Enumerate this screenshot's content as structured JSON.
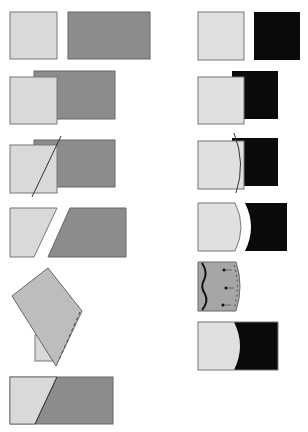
{
  "diagram": {
    "type": "seam-construction-steps",
    "colors": {
      "light_fabric": "#d9d9d9",
      "medium_fabric": "#8c8c8c",
      "dark_fabric": "#0a0a0a",
      "outline": "#6e6e6e",
      "cut_line": "#333333",
      "background": "#ffffff"
    },
    "columns": [
      {
        "name": "straight-seam",
        "steps": [
          {
            "id": "L1",
            "description": "Two separate pieces: light square and medium rectangle"
          },
          {
            "id": "L2",
            "description": "Light square overlapped on medium rectangle"
          },
          {
            "id": "L3",
            "description": "Diagonal cut line through overlap"
          },
          {
            "id": "L4",
            "description": "Pieces cut apart along diagonal"
          },
          {
            "id": "L5",
            "description": "Light piece flipped over and stitched along seam"
          },
          {
            "id": "L6",
            "description": "Finished joined rectangle with diagonal seam"
          }
        ]
      },
      {
        "name": "curved-seam",
        "steps": [
          {
            "id": "R1",
            "description": "Two separate pieces: light square and black square"
          },
          {
            "id": "R2",
            "description": "Light square overlapped on black square"
          },
          {
            "id": "R3",
            "description": "Curved cut line through overlap"
          },
          {
            "id": "R4",
            "description": "Pieces cut apart along curve"
          },
          {
            "id": "R5",
            "description": "Pieces pinned along curved edge"
          },
          {
            "id": "R6",
            "description": "Finished joined piece with curved seam"
          }
        ]
      }
    ]
  }
}
